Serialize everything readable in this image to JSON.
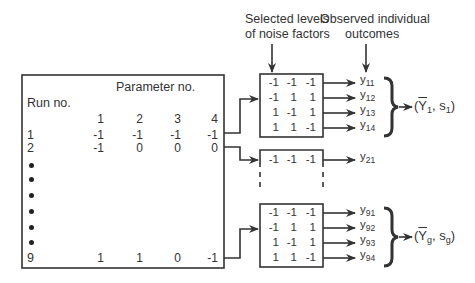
{
  "headers": {
    "noise_levels_line1": "Selected levels",
    "noise_levels_line2": "of noise factors",
    "outcomes_line1": "Observed individual",
    "outcomes_line2": "outcomes"
  },
  "param_table": {
    "title": "Parameter no.",
    "run_label": "Run no.",
    "param_numbers": [
      "1",
      "2",
      "3",
      "4"
    ],
    "rows": [
      {
        "run": "1",
        "values": [
          "-1",
          "-1",
          "-1",
          "-1"
        ]
      },
      {
        "run": "2",
        "values": [
          "-1",
          "0",
          "0",
          "0"
        ]
      },
      {
        "run": "9",
        "values": [
          "1",
          "1",
          "0",
          "-1"
        ]
      }
    ],
    "ellipsis_dots": 6
  },
  "noise_boxes": [
    {
      "run": "1",
      "rows": [
        [
          "-1",
          "-1",
          "-1"
        ],
        [
          "-1",
          "1",
          "1"
        ],
        [
          "1",
          "-1",
          "1"
        ],
        [
          "1",
          "1",
          "-1"
        ]
      ],
      "outcomes": [
        {
          "y": "y",
          "sub": "11"
        },
        {
          "y": "y",
          "sub": "12"
        },
        {
          "y": "y",
          "sub": "13"
        },
        {
          "y": "y",
          "sub": "14"
        }
      ],
      "result": {
        "mean": "Y",
        "mean_sub": "1",
        "sd": "s",
        "sd_sub": "1"
      }
    },
    {
      "run": "2",
      "rows": [
        [
          "-1",
          "-1",
          "-1"
        ]
      ],
      "outcomes": [
        {
          "y": "y",
          "sub": "21"
        }
      ]
    },
    {
      "run": "9",
      "rows": [
        [
          "-1",
          "-1",
          "-1"
        ],
        [
          "-1",
          "1",
          "1"
        ],
        [
          "1",
          "-1",
          "1"
        ],
        [
          "1",
          "1",
          "-1"
        ]
      ],
      "outcomes": [
        {
          "y": "y",
          "sub": "91"
        },
        {
          "y": "y",
          "sub": "92"
        },
        {
          "y": "y",
          "sub": "93"
        },
        {
          "y": "y",
          "sub": "94"
        }
      ],
      "result": {
        "mean": "Y",
        "mean_sub": "g",
        "sd": "s",
        "sd_sub": "g"
      }
    }
  ]
}
